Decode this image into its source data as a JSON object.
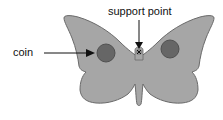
{
  "diagram": {
    "labels": {
      "coin": "coin",
      "support_point": "support point"
    },
    "colors": {
      "wing_fill": "#a6a6a6",
      "wing_stroke": "#6a6a6a",
      "coin_fill": "#666666",
      "coin_stroke": "#505050",
      "arrow": "#111111",
      "background": "#ffffff"
    },
    "elements": {
      "butterfly": "butterfly cut-out shape",
      "coins": 2,
      "support_marker": "x"
    }
  }
}
